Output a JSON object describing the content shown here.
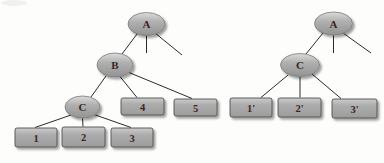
{
  "figure": {
    "background": "#fdfdfb",
    "colors": {
      "node_fill": "#adadad",
      "node_highlight": "#dcdcdc",
      "node_shade": "#939393",
      "node_border": "#4e4e4e",
      "edge": "#2b2b2b",
      "label": "#3b2523",
      "shadow": "rgba(0,0,0,0.38)"
    },
    "left_tree": {
      "A": "A",
      "B": "B",
      "C": "C",
      "n1": "1",
      "n2": "2",
      "n3": "3",
      "n4": "4",
      "n5": "5",
      "edges": [
        [
          "A",
          "B"
        ],
        [
          "A",
          null
        ],
        [
          "A",
          null
        ],
        [
          "B",
          "C"
        ],
        [
          "B",
          "4"
        ],
        [
          "B",
          "5"
        ],
        [
          "C",
          "1"
        ],
        [
          "C",
          "2"
        ],
        [
          "C",
          "3"
        ]
      ]
    },
    "right_tree": {
      "A": "A",
      "C": "C",
      "n1": "1'",
      "n2": "2'",
      "n3": "3'",
      "edges": [
        [
          "A",
          "C"
        ],
        [
          "A",
          null
        ],
        [
          "A",
          null
        ],
        [
          "C",
          "1'"
        ],
        [
          "C",
          "2'"
        ],
        [
          "C",
          "3'"
        ]
      ]
    }
  }
}
